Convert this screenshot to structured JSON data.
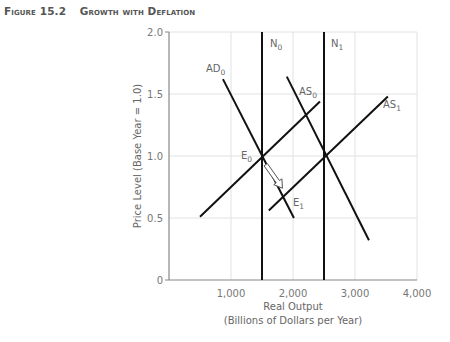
{
  "figure": {
    "number": "Figure 15.2",
    "title": "Growth with Deflation"
  },
  "chart_data": {
    "type": "line",
    "title": "Growth with Deflation",
    "xlabel": "Real Output",
    "xlabel_sub": "(Billions of Dollars per Year)",
    "ylabel": "Price Level (Base Year = 1.0)",
    "xlim": [
      0,
      4000
    ],
    "ylim": [
      0,
      2.0
    ],
    "grid": true,
    "x_ticks": [
      {
        "value": 1000,
        "label": "1,000"
      },
      {
        "value": 2000,
        "label": "2,000"
      },
      {
        "value": 3000,
        "label": "3,000"
      },
      {
        "value": 4000,
        "label": "4,000"
      }
    ],
    "y_ticks": [
      {
        "value": 0,
        "label": "0"
      },
      {
        "value": 0.5,
        "label": "0.5"
      },
      {
        "value": 1.0,
        "label": "1.0"
      },
      {
        "value": 1.5,
        "label": "1.5"
      },
      {
        "value": 2.0,
        "label": "2.0"
      }
    ],
    "series": [
      {
        "name": "N0",
        "label": "N",
        "sub": "0",
        "points": [
          [
            1500,
            0
          ],
          [
            1500,
            2.0
          ]
        ]
      },
      {
        "name": "N1",
        "label": "N",
        "sub": "1",
        "points": [
          [
            2500,
            0
          ],
          [
            2500,
            2.0
          ]
        ]
      },
      {
        "name": "AD0",
        "label": "AD",
        "sub": "0",
        "points": [
          [
            870,
            1.62
          ],
          [
            2015,
            0.5
          ]
        ]
      },
      {
        "name": "AD1",
        "label": "",
        "sub": "",
        "points": [
          [
            1900,
            1.64
          ],
          [
            3225,
            0.32
          ]
        ]
      },
      {
        "name": "AS0",
        "label": "AS",
        "sub": "0",
        "points": [
          [
            500,
            0.51
          ],
          [
            2435,
            1.44
          ]
        ]
      },
      {
        "name": "AS1",
        "label": "AS",
        "sub": "1",
        "points": [
          [
            1610,
            0.56
          ],
          [
            3530,
            1.48
          ]
        ]
      }
    ],
    "annotations": [
      {
        "name": "E0",
        "label": "E",
        "sub": "0",
        "point": [
          1500,
          1.0
        ]
      },
      {
        "name": "E1",
        "label": "E",
        "sub": "1",
        "point": [
          1895,
          0.71
        ]
      }
    ],
    "arrow": {
      "from": [
        1560,
        0.93
      ],
      "to": [
        1830,
        0.74
      ]
    }
  }
}
